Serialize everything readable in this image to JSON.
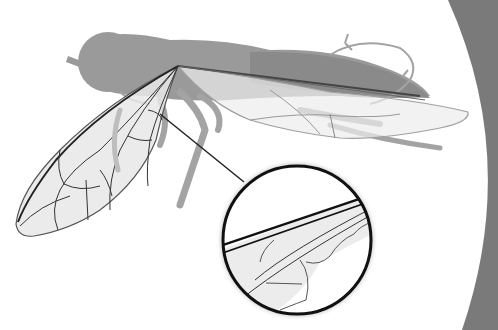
{
  "figure": {
    "title": "",
    "colors": {
      "background": "#ffffff",
      "corner_arc": "#7a7a7a",
      "body_silhouette": "#9a9a9a",
      "body_shade": "#8a8a8a",
      "wing_fill": "#e8e8e8",
      "wing_vein": "#333333",
      "wing_outline": "#555555",
      "hind_wing_outline": "#a0a0a0",
      "leg": "#a3a3a3",
      "inset_border": "#111111",
      "inset_fill": "#ffffff",
      "pointer_line": "#222222"
    },
    "elements": {
      "body": "fly-body-silhouette",
      "front_wing": "front-wing",
      "hind_wing": "hind-wing",
      "inset": "magnifier-inset",
      "pointer": "pointer-line"
    }
  }
}
